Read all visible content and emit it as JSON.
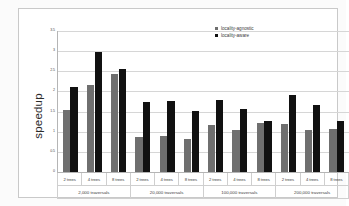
{
  "chart_data": {
    "type": "bar",
    "title": "",
    "xlabel": "",
    "ylabel": "speedup",
    "ylim": [
      0,
      3.5
    ],
    "yticks": [
      "0",
      "0.5",
      "1",
      "1.5",
      "2",
      "2.5",
      "3",
      "3.5"
    ],
    "ytick_values": [
      0,
      0.5,
      1,
      1.5,
      2,
      2.5,
      3,
      3.5
    ],
    "grid": true,
    "legend_position": "top-right",
    "legend": [
      "locality-agnostic",
      "locality-aware"
    ],
    "group_labels": [
      "2,000 traversals",
      "20,000 traversals",
      "100,000 traversals",
      "200,000 traversals"
    ],
    "categories": [
      "2 trees",
      "4 trees",
      "8 trees",
      "2 trees",
      "4 trees",
      "8 trees",
      "2 trees",
      "4 trees",
      "8 trees",
      "2 trees",
      "4 trees",
      "8 trees"
    ],
    "series": [
      {
        "name": "locality-agnostic",
        "color": "#6f6f6f",
        "values": [
          1.55,
          2.15,
          2.44,
          0.88,
          0.89,
          0.82,
          1.17,
          1.05,
          1.22,
          1.18,
          1.05,
          1.06
        ]
      },
      {
        "name": "locality-aware",
        "color": "#111111",
        "values": [
          2.1,
          2.99,
          2.55,
          1.75,
          1.77,
          1.51,
          1.78,
          1.57,
          1.27,
          1.92,
          1.66,
          1.26
        ]
      }
    ]
  }
}
